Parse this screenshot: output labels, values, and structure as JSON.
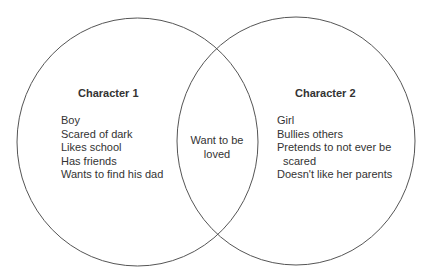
{
  "diagram": {
    "type": "venn",
    "stroke_color": "#555555",
    "left": {
      "title": "Character 1",
      "items": [
        "Boy",
        "Scared of dark",
        "Likes school",
        "Has friends",
        "Wants to find his dad"
      ]
    },
    "right": {
      "title": "Character 2",
      "items": [
        "Girl",
        "Bullies others",
        "Pretends to not ever be",
        "scared",
        "Doesn't like her parents"
      ]
    },
    "overlap": {
      "lines": [
        "Want to be",
        "loved"
      ]
    }
  }
}
